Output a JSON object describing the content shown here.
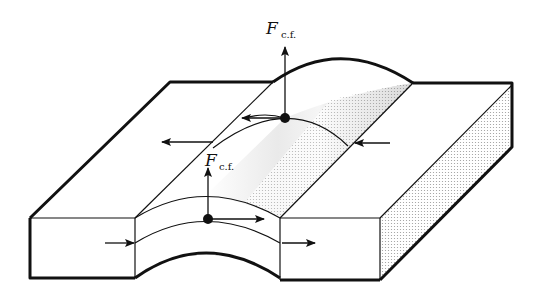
{
  "diagram": {
    "labels": {
      "force_top": {
        "symbol": "F",
        "subscript": "c.f."
      },
      "force_front": {
        "symbol": "F",
        "subscript": "c.f."
      }
    },
    "colors": {
      "line": "#111111",
      "background": "#ffffff",
      "shade_light": "#d9d9d9",
      "shade_dark": "#7a7a7a"
    }
  }
}
